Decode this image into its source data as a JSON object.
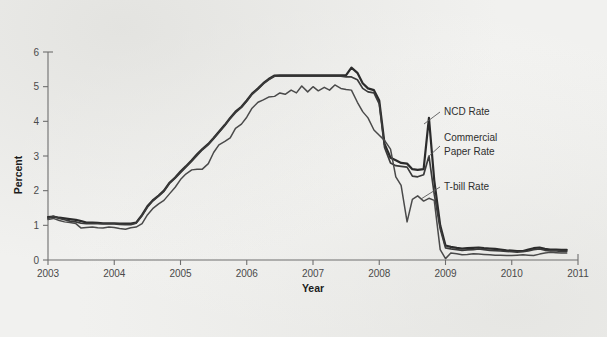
{
  "chart_data": {
    "type": "line",
    "title": "",
    "xlabel": "Year",
    "ylabel": "Percent",
    "xlim": [
      2003,
      2011
    ],
    "ylim": [
      0,
      6
    ],
    "grid": false,
    "legend_position": "inline-annotations",
    "xticks": [
      "2003",
      "2004",
      "2005",
      "2006",
      "2007",
      "2008",
      "2009",
      "2010",
      "2011"
    ],
    "yticks": [
      "0",
      "1",
      "2",
      "3",
      "4",
      "5",
      "6"
    ],
    "annotations": [
      {
        "id": "ncd",
        "text": "NCD Rate",
        "lines": [
          "NCD Rate"
        ]
      },
      {
        "id": "cp",
        "text": "Commercial Paper Rate",
        "lines": [
          "Commercial",
          "Paper Rate"
        ]
      },
      {
        "id": "tbill",
        "text": "T-bill Rate",
        "lines": [
          "T-bill Rate"
        ]
      }
    ],
    "series": [
      {
        "name": "NCD Rate",
        "color": "#2b2b2b",
        "x": [
          2003.0,
          2003.08,
          2003.17,
          2003.25,
          2003.33,
          2003.42,
          2003.5,
          2003.58,
          2003.67,
          2003.75,
          2003.83,
          2003.92,
          2004.0,
          2004.08,
          2004.17,
          2004.25,
          2004.33,
          2004.42,
          2004.5,
          2004.58,
          2004.67,
          2004.75,
          2004.83,
          2004.92,
          2005.0,
          2005.08,
          2005.17,
          2005.25,
          2005.33,
          2005.42,
          2005.5,
          2005.58,
          2005.67,
          2005.75,
          2005.83,
          2005.92,
          2006.0,
          2006.08,
          2006.17,
          2006.25,
          2006.33,
          2006.42,
          2006.5,
          2006.58,
          2006.67,
          2006.75,
          2006.83,
          2006.92,
          2007.0,
          2007.08,
          2007.17,
          2007.25,
          2007.33,
          2007.42,
          2007.5,
          2007.58,
          2007.67,
          2007.75,
          2007.83,
          2007.92,
          2008.0,
          2008.08,
          2008.17,
          2008.25,
          2008.33,
          2008.42,
          2008.5,
          2008.58,
          2008.67,
          2008.75,
          2008.83,
          2008.92,
          2009.0,
          2009.08,
          2009.17,
          2009.25,
          2009.33,
          2009.42,
          2009.5,
          2009.58,
          2009.67,
          2009.75,
          2009.83,
          2009.92,
          2010.0,
          2010.08,
          2010.17,
          2010.25,
          2010.33,
          2010.42,
          2010.5,
          2010.58,
          2010.67,
          2010.75,
          2010.83
        ],
        "values": [
          1.24,
          1.25,
          1.22,
          1.2,
          1.18,
          1.16,
          1.12,
          1.08,
          1.08,
          1.07,
          1.06,
          1.06,
          1.06,
          1.05,
          1.05,
          1.05,
          1.08,
          1.3,
          1.55,
          1.72,
          1.86,
          2.0,
          2.22,
          2.38,
          2.55,
          2.7,
          2.88,
          3.05,
          3.2,
          3.35,
          3.52,
          3.7,
          3.9,
          4.1,
          4.28,
          4.42,
          4.6,
          4.8,
          4.95,
          5.1,
          5.22,
          5.32,
          5.33,
          5.33,
          5.33,
          5.33,
          5.33,
          5.33,
          5.33,
          5.33,
          5.33,
          5.33,
          5.33,
          5.33,
          5.33,
          5.55,
          5.4,
          5.1,
          4.95,
          4.9,
          4.6,
          3.35,
          2.95,
          2.88,
          2.8,
          2.78,
          2.62,
          2.6,
          2.62,
          4.1,
          2.3,
          1.0,
          0.42,
          0.38,
          0.35,
          0.33,
          0.34,
          0.35,
          0.36,
          0.34,
          0.33,
          0.32,
          0.3,
          0.28,
          0.27,
          0.26,
          0.26,
          0.3,
          0.34,
          0.36,
          0.32,
          0.3,
          0.3,
          0.29,
          0.29
        ]
      },
      {
        "name": "Commercial Paper Rate",
        "color": "#3a3a3a",
        "x": [
          2003.0,
          2003.08,
          2003.17,
          2003.25,
          2003.33,
          2003.42,
          2003.5,
          2003.58,
          2003.67,
          2003.75,
          2003.83,
          2003.92,
          2004.0,
          2004.08,
          2004.17,
          2004.25,
          2004.33,
          2004.42,
          2004.5,
          2004.58,
          2004.67,
          2004.75,
          2004.83,
          2004.92,
          2005.0,
          2005.08,
          2005.17,
          2005.25,
          2005.33,
          2005.42,
          2005.5,
          2005.58,
          2005.67,
          2005.75,
          2005.83,
          2005.92,
          2006.0,
          2006.08,
          2006.17,
          2006.25,
          2006.33,
          2006.42,
          2006.5,
          2006.58,
          2006.67,
          2006.75,
          2006.83,
          2006.92,
          2007.0,
          2007.08,
          2007.17,
          2007.25,
          2007.33,
          2007.42,
          2007.5,
          2007.58,
          2007.67,
          2007.75,
          2007.83,
          2007.92,
          2008.0,
          2008.08,
          2008.17,
          2008.25,
          2008.33,
          2008.42,
          2008.5,
          2008.58,
          2008.67,
          2008.75,
          2008.83,
          2008.92,
          2009.0,
          2009.08,
          2009.17,
          2009.25,
          2009.33,
          2009.42,
          2009.5,
          2009.58,
          2009.67,
          2009.75,
          2009.83,
          2009.92,
          2010.0,
          2010.08,
          2010.17,
          2010.25,
          2010.33,
          2010.42,
          2010.5,
          2010.58,
          2010.67,
          2010.75,
          2010.83
        ],
        "values": [
          1.2,
          1.26,
          1.2,
          1.16,
          1.12,
          1.1,
          1.06,
          1.05,
          1.05,
          1.05,
          1.04,
          1.04,
          1.04,
          1.03,
          1.02,
          1.02,
          1.06,
          1.28,
          1.52,
          1.7,
          1.84,
          1.98,
          2.2,
          2.36,
          2.52,
          2.68,
          2.85,
          3.02,
          3.18,
          3.33,
          3.5,
          3.68,
          3.88,
          4.08,
          4.25,
          4.4,
          4.58,
          4.78,
          4.93,
          5.08,
          5.2,
          5.3,
          5.3,
          5.3,
          5.3,
          5.3,
          5.3,
          5.3,
          5.3,
          5.3,
          5.3,
          5.3,
          5.3,
          5.3,
          5.28,
          5.28,
          5.2,
          4.95,
          4.85,
          4.82,
          4.5,
          3.25,
          2.8,
          2.72,
          2.7,
          2.68,
          2.42,
          2.4,
          2.46,
          3.0,
          1.9,
          0.9,
          0.35,
          0.32,
          0.3,
          0.28,
          0.29,
          0.3,
          0.32,
          0.3,
          0.28,
          0.27,
          0.26,
          0.25,
          0.24,
          0.23,
          0.24,
          0.26,
          0.3,
          0.32,
          0.28,
          0.26,
          0.26,
          0.25,
          0.25
        ]
      },
      {
        "name": "T-bill Rate",
        "color": "#4a4a4a",
        "x": [
          2003.0,
          2003.08,
          2003.17,
          2003.25,
          2003.33,
          2003.42,
          2003.5,
          2003.58,
          2003.67,
          2003.75,
          2003.83,
          2003.92,
          2004.0,
          2004.08,
          2004.17,
          2004.25,
          2004.33,
          2004.42,
          2004.5,
          2004.58,
          2004.67,
          2004.75,
          2004.83,
          2004.92,
          2005.0,
          2005.08,
          2005.17,
          2005.25,
          2005.33,
          2005.42,
          2005.5,
          2005.58,
          2005.67,
          2005.75,
          2005.83,
          2005.92,
          2006.0,
          2006.08,
          2006.17,
          2006.25,
          2006.33,
          2006.42,
          2006.5,
          2006.58,
          2006.67,
          2006.75,
          2006.83,
          2006.92,
          2007.0,
          2007.08,
          2007.17,
          2007.25,
          2007.33,
          2007.42,
          2007.5,
          2007.58,
          2007.67,
          2007.75,
          2007.83,
          2007.92,
          2008.0,
          2008.08,
          2008.17,
          2008.25,
          2008.33,
          2008.42,
          2008.5,
          2008.58,
          2008.67,
          2008.75,
          2008.83,
          2008.92,
          2009.0,
          2009.08,
          2009.17,
          2009.25,
          2009.33,
          2009.42,
          2009.5,
          2009.58,
          2009.67,
          2009.75,
          2009.83,
          2009.92,
          2010.0,
          2010.08,
          2010.17,
          2010.25,
          2010.33,
          2010.42,
          2010.5,
          2010.58,
          2010.67,
          2010.75,
          2010.83
        ],
        "values": [
          1.17,
          1.2,
          1.14,
          1.1,
          1.08,
          1.05,
          0.92,
          0.94,
          0.95,
          0.93,
          0.92,
          0.95,
          0.94,
          0.91,
          0.89,
          0.93,
          0.95,
          1.05,
          1.3,
          1.48,
          1.62,
          1.72,
          1.9,
          2.1,
          2.32,
          2.48,
          2.6,
          2.62,
          2.62,
          2.78,
          3.1,
          3.32,
          3.42,
          3.52,
          3.8,
          3.92,
          4.12,
          4.38,
          4.55,
          4.62,
          4.7,
          4.72,
          4.82,
          4.78,
          4.9,
          4.82,
          5.02,
          4.85,
          5.0,
          4.88,
          4.98,
          4.9,
          5.05,
          4.95,
          4.92,
          4.9,
          4.55,
          4.28,
          4.1,
          3.75,
          3.6,
          3.45,
          3.2,
          2.4,
          2.15,
          1.1,
          1.75,
          1.85,
          1.7,
          1.78,
          1.72,
          0.3,
          0.04,
          0.2,
          0.18,
          0.15,
          0.16,
          0.18,
          0.17,
          0.16,
          0.15,
          0.14,
          0.14,
          0.13,
          0.13,
          0.14,
          0.15,
          0.14,
          0.13,
          0.17,
          0.2,
          0.22,
          0.21,
          0.2,
          0.2
        ]
      }
    ]
  }
}
